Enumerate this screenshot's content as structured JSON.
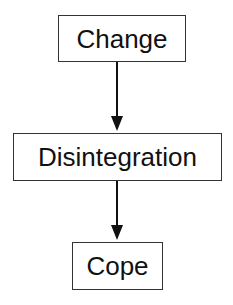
{
  "diagram": {
    "type": "flowchart",
    "nodes": [
      {
        "id": "change",
        "label": "Change"
      },
      {
        "id": "disintegration",
        "label": "Disintegration"
      },
      {
        "id": "cope",
        "label": "Cope"
      }
    ],
    "edges": [
      {
        "from": "change",
        "to": "disintegration"
      },
      {
        "from": "disintegration",
        "to": "cope"
      }
    ]
  }
}
